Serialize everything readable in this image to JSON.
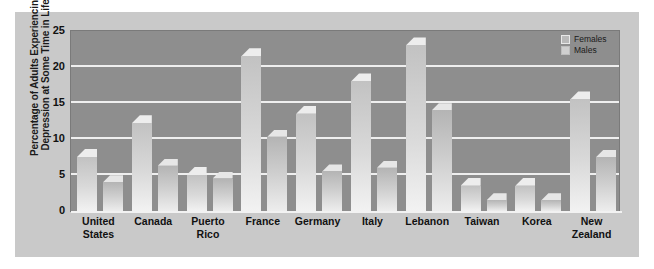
{
  "chart_data": {
    "type": "bar",
    "title": "",
    "xlabel": "",
    "ylabel": "Percentage of Adults Experiencing Depression at Some Time in Life",
    "ylabel_line1": "Percentage of Adults Experiencing",
    "ylabel_line2": "Depression at Some Time in Life",
    "ylim": [
      0,
      25
    ],
    "yticks": [
      25,
      20,
      15,
      10,
      5,
      0
    ],
    "grid": true,
    "legend_position": "top-right",
    "categories": [
      "United States",
      "Canada",
      "Puerto Rico",
      "France",
      "Germany",
      "Italy",
      "Lebanon",
      "Taiwan",
      "Korea",
      "New Zealand"
    ],
    "category_lines": [
      [
        "United",
        "States"
      ],
      [
        "Canada"
      ],
      [
        "Puerto",
        "Rico"
      ],
      [
        "France"
      ],
      [
        "Germany"
      ],
      [
        "Italy"
      ],
      [
        "Lebanon"
      ],
      [
        "Taiwan"
      ],
      [
        "Korea"
      ],
      [
        "New",
        "Zealand"
      ]
    ],
    "series": [
      {
        "name": "Females",
        "values": [
          7.5,
          12.2,
          5.0,
          21.5,
          13.5,
          18.0,
          23.0,
          3.5,
          3.5,
          15.5
        ]
      },
      {
        "name": "Males",
        "values": [
          4.0,
          6.3,
          4.5,
          10.3,
          5.5,
          6.0,
          14.0,
          1.5,
          1.5,
          7.5
        ]
      }
    ]
  },
  "legend": {
    "items": [
      {
        "label": "Females"
      },
      {
        "label": "Males"
      }
    ]
  },
  "colors": {
    "figure_background": "#c9c9c9",
    "plot_background": "#8e8e8e",
    "gridline": "#efefef",
    "female_bar": "#d9d9d9",
    "male_bar": "#cfcfcf",
    "text": "#111111"
  }
}
